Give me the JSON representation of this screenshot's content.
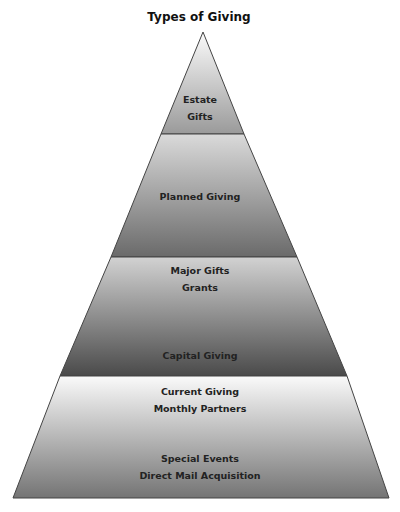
{
  "title": "Types of Giving",
  "tiers": [
    {
      "lines": [
        "Estate",
        "Gifts"
      ]
    },
    {
      "lines": [
        "Planned Giving"
      ]
    },
    {
      "lines": [
        "Major Gifts",
        "Grants"
      ],
      "bottom": "Capital Giving"
    },
    {
      "lines": [
        "Current Giving",
        "Monthly Partners"
      ],
      "bottom_lines": [
        "Special Events",
        "Direct Mail Acquisition"
      ]
    }
  ]
}
